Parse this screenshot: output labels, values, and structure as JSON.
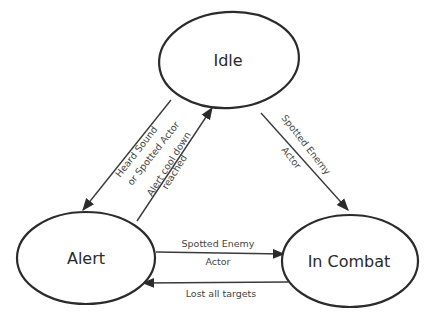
{
  "diagram": {
    "type": "state-machine",
    "colors": {
      "stroke": "#2b2b2b",
      "text": "#2a2a2a",
      "background": "#ffffff"
    },
    "states": [
      {
        "id": "idle",
        "label": "Idle"
      },
      {
        "id": "alert",
        "label": "Alert"
      },
      {
        "id": "combat",
        "label": "In Combat"
      }
    ],
    "transitions": [
      {
        "from": "idle",
        "to": "alert",
        "line1": "Heard Sound",
        "line2": "or Spotted Actor"
      },
      {
        "from": "alert",
        "to": "idle",
        "line1": "Alert cool down",
        "line2": "reached"
      },
      {
        "from": "idle",
        "to": "combat",
        "line1": "Spotted Enemy",
        "line2": "Actor"
      },
      {
        "from": "alert",
        "to": "combat",
        "line1": "Spotted Enemy",
        "line2": "Actor"
      },
      {
        "from": "combat",
        "to": "alert",
        "line1": "Lost all targets"
      }
    ]
  }
}
